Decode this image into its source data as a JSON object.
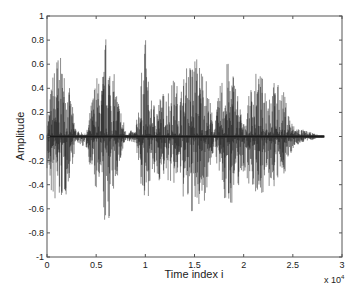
{
  "chart_data": {
    "type": "line",
    "title": "",
    "xlabel": "Time index i",
    "ylabel": "Amplitude",
    "x_multiplier": "x 10^4",
    "xlim": [
      0,
      3
    ],
    "ylim": [
      -1,
      1
    ],
    "xticks": [
      0,
      0.5,
      1,
      1.5,
      2,
      2.5,
      3
    ],
    "xtick_labels": [
      "0",
      "0.5",
      "1",
      "1.5",
      "2",
      "2.5",
      "3"
    ],
    "yticks": [
      -1,
      -0.8,
      -0.6,
      -0.4,
      -0.2,
      0,
      0.2,
      0.4,
      0.6,
      0.8,
      1
    ],
    "ytick_labels": [
      "-1",
      "-0.8",
      "-0.6",
      "-0.4",
      "-0.2",
      "0",
      "0.2",
      "0.4",
      "0.6",
      "0.8",
      "1"
    ],
    "grid": false,
    "series": [
      {
        "name": "speech waveform",
        "color": "#1a1a1a",
        "signal_end_x": 2.82,
        "envelope_x": [
          0.0,
          0.05,
          0.1,
          0.2,
          0.3,
          0.4,
          0.5,
          0.55,
          0.6,
          0.7,
          0.8,
          0.9,
          1.0,
          1.05,
          1.1,
          1.2,
          1.3,
          1.35,
          1.4,
          1.5,
          1.6,
          1.7,
          1.8,
          1.9,
          2.0,
          2.1,
          2.2,
          2.3,
          2.4,
          2.5,
          2.6,
          2.7,
          2.82
        ],
        "envelope_pos": [
          0.1,
          0.5,
          0.72,
          0.55,
          0.05,
          0.02,
          0.55,
          0.4,
          0.88,
          0.45,
          0.05,
          0.05,
          0.85,
          0.3,
          0.3,
          0.4,
          0.5,
          0.38,
          0.55,
          0.72,
          0.6,
          0.1,
          0.65,
          0.58,
          0.1,
          0.55,
          0.5,
          0.48,
          0.4,
          0.1,
          0.06,
          0.03,
          0.0
        ],
        "envelope_neg": [
          -0.3,
          -0.55,
          -0.6,
          -0.5,
          -0.05,
          -0.1,
          -0.5,
          -0.5,
          -0.85,
          -0.4,
          -0.05,
          -0.05,
          -0.73,
          -0.35,
          -0.4,
          -0.35,
          -0.45,
          -0.35,
          -0.6,
          -0.68,
          -0.55,
          -0.1,
          -0.6,
          -0.55,
          -0.3,
          -0.48,
          -0.48,
          -0.45,
          -0.35,
          -0.1,
          -0.05,
          -0.03,
          0.0
        ]
      }
    ]
  },
  "footer": "Fig. 4. speech signal"
}
